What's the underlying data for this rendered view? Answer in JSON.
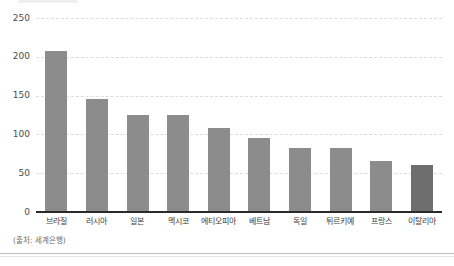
{
  "chart_data": {
    "type": "bar",
    "title": "",
    "subtitle": "",
    "xlabel": "",
    "ylabel": "",
    "ylim": [
      0,
      250
    ],
    "yticks": [
      0,
      50,
      100,
      150,
      200,
      250
    ],
    "grid": true,
    "legend": null,
    "categories": [
      "브라질",
      "러시아",
      "일본",
      "멕시코",
      "에티오피아",
      "베트남",
      "독일",
      "튀르키예",
      "프랑스",
      "이탈리아"
    ],
    "values": [
      208,
      145,
      125,
      125,
      108,
      95,
      82,
      82,
      66,
      61
    ],
    "highlight_index": 9,
    "bar_color": "#8c8c8c",
    "highlight_color": "#6e6e6e",
    "gridline_color": "#dcdcdc",
    "axis_color": "#2b2b2b"
  },
  "annotations": {
    "source_note": "(출처: 세계은행)"
  }
}
